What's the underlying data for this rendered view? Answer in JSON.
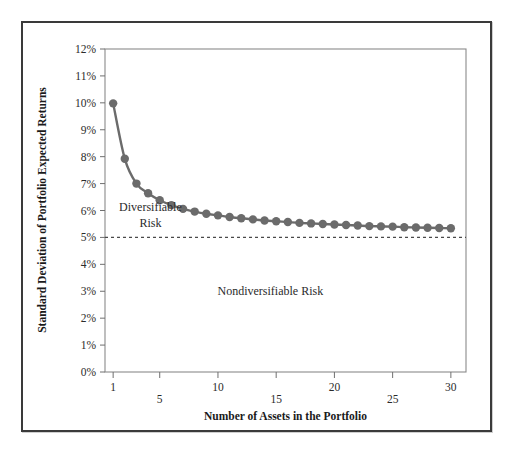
{
  "figure": {
    "background_color": "#ffffff",
    "frame_color": "#3a3a3a"
  },
  "chart_data": {
    "type": "line",
    "title": "",
    "subtitle": "",
    "xlabel": "Number of Assets in the Portfolio",
    "ylabel": "Standard Deviation of Portfolio Expected Returns",
    "xlim": [
      0.3,
      31.3
    ],
    "ylim": [
      0,
      12
    ],
    "grid": false,
    "legend": "none",
    "series_color": "#6b6b6b",
    "marker": "circle",
    "marker_size": 4.2,
    "line_width": 2.4,
    "xticks": [
      1,
      5,
      10,
      15,
      20,
      25,
      30
    ],
    "xtick_labels": [
      "1",
      "5",
      "10",
      "15",
      "20",
      "25",
      "30"
    ],
    "yticks": [
      0,
      1,
      2,
      3,
      4,
      5,
      6,
      7,
      8,
      9,
      10,
      11,
      12
    ],
    "ytick_labels": [
      "0%",
      "1%",
      "2%",
      "3%",
      "4%",
      "5%",
      "6%",
      "7%",
      "8%",
      "9%",
      "10%",
      "11%",
      "12%"
    ],
    "x": [
      1,
      2,
      3,
      4,
      5,
      6,
      7,
      8,
      9,
      10,
      11,
      12,
      13,
      14,
      15,
      16,
      17,
      18,
      19,
      20,
      21,
      22,
      23,
      24,
      25,
      26,
      27,
      28,
      29,
      30
    ],
    "values": [
      9.98,
      7.92,
      7.0,
      6.64,
      6.38,
      6.2,
      6.06,
      5.96,
      5.88,
      5.82,
      5.76,
      5.71,
      5.67,
      5.63,
      5.6,
      5.57,
      5.54,
      5.52,
      5.5,
      5.48,
      5.46,
      5.44,
      5.42,
      5.41,
      5.4,
      5.38,
      5.37,
      5.36,
      5.35,
      5.34
    ],
    "reference_line": {
      "name": "nondiversifiable-risk-level",
      "y": 5.0,
      "style": "dashed",
      "color": "#4a4a4a"
    },
    "annotations": [
      {
        "name": "diversifiable-risk-label",
        "text_line1": "Diversifiable",
        "text_line2": "Risk",
        "x": 4.2,
        "y": 6.0
      },
      {
        "name": "nondiversifiable-risk-label",
        "text": "Nondiversifiable Risk",
        "x": 14.5,
        "y": 2.85
      }
    ]
  }
}
